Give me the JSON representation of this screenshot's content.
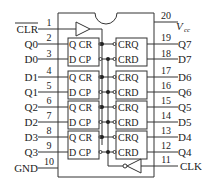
{
  "diagram": {
    "type": "IC pinout",
    "left_pins": [
      {
        "num": "1",
        "label": "CLR",
        "overline": true
      },
      {
        "num": "2",
        "label": "Q0"
      },
      {
        "num": "3",
        "label": "D0"
      },
      {
        "num": "4",
        "label": "D1"
      },
      {
        "num": "5",
        "label": "Q1"
      },
      {
        "num": "6",
        "label": "Q2"
      },
      {
        "num": "7",
        "label": "D2"
      },
      {
        "num": "8",
        "label": "D3"
      },
      {
        "num": "9",
        "label": "Q3"
      },
      {
        "num": "10",
        "label": "GND"
      }
    ],
    "right_pins": [
      {
        "num": "20",
        "label": "V",
        "sub": "cc"
      },
      {
        "num": "19",
        "label": "Q7"
      },
      {
        "num": "18",
        "label": "D7"
      },
      {
        "num": "17",
        "label": "D6"
      },
      {
        "num": "16",
        "label": "Q6"
      },
      {
        "num": "15",
        "label": "Q5"
      },
      {
        "num": "14",
        "label": "D5"
      },
      {
        "num": "13",
        "label": "D4"
      },
      {
        "num": "12",
        "label": "Q4"
      },
      {
        "num": "11",
        "label": "CLK"
      }
    ],
    "left_cells": {
      "top": "Q CR",
      "bottom": "D CP"
    },
    "right_cells": {
      "top": "CRQ",
      "bottom": "CRD"
    }
  }
}
